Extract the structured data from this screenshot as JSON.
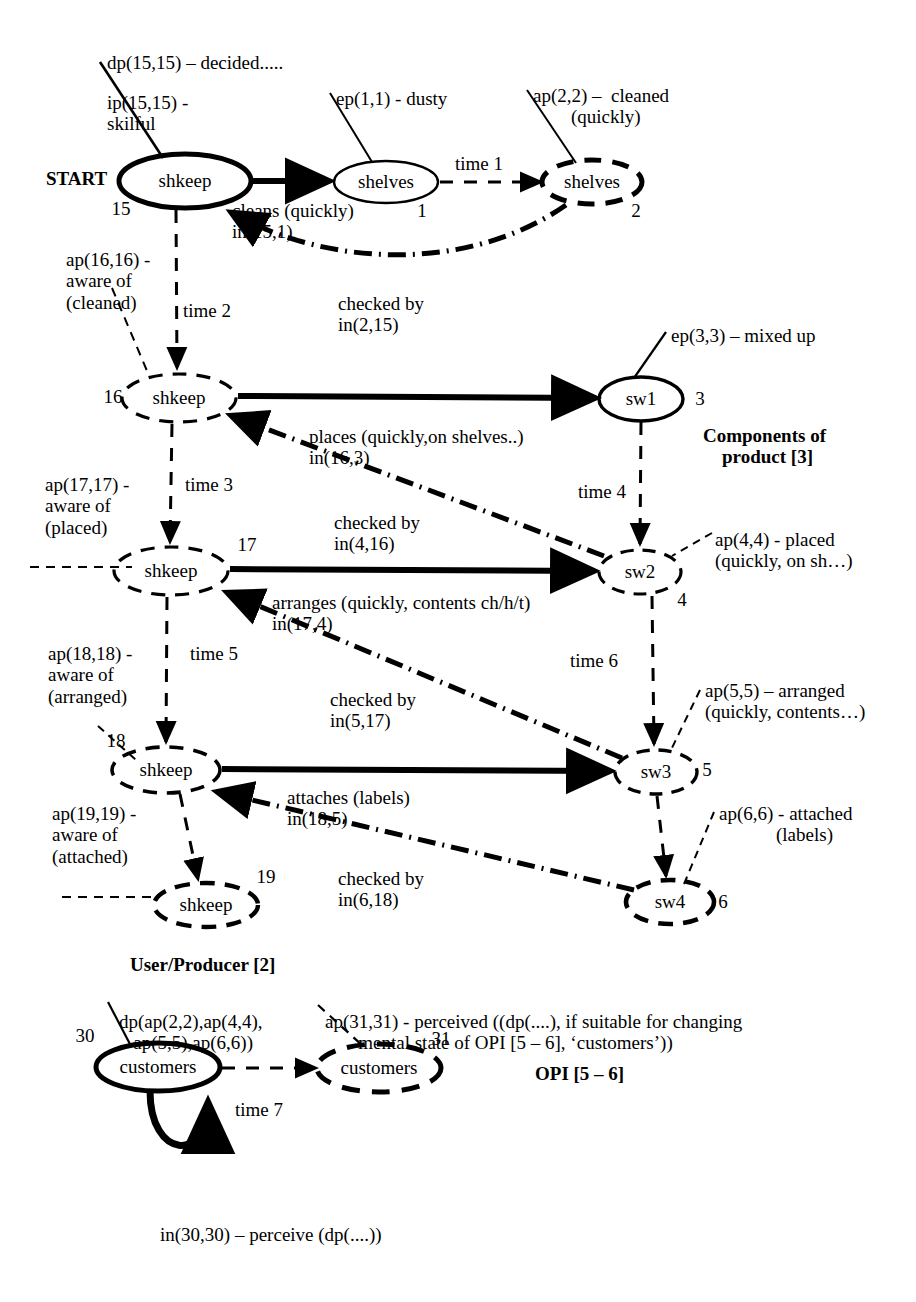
{
  "diagram": {
    "type": "state-transition-diagram",
    "colors": {
      "ink": "#000000",
      "paper": "#ffffff"
    },
    "groups": [
      {
        "id": "g-components",
        "label": "Components of\nproduct [3]"
      },
      {
        "id": "g-userproducer",
        "label": "User/Producer [2]"
      },
      {
        "id": "g-opi",
        "label": "OPI [5 – 6]"
      }
    ],
    "nodes": [
      {
        "id": "n15",
        "label": "shkeep",
        "num": "15",
        "style": "solid-bold",
        "cx": 185,
        "cy": 181,
        "rx": 66,
        "ry": 27,
        "num_x": 121,
        "num_y": 209
      },
      {
        "id": "n1",
        "label": "shelves",
        "num": "1",
        "style": "solid-thin",
        "cx": 386,
        "cy": 182,
        "rx": 52,
        "ry": 21,
        "num_x": 422,
        "num_y": 211
      },
      {
        "id": "n2",
        "label": "shelves",
        "num": "2",
        "style": "dashed-bold",
        "cx": 592,
        "cy": 182,
        "rx": 50,
        "ry": 22,
        "num_x": 636,
        "num_y": 211
      },
      {
        "id": "n16",
        "label": "shkeep",
        "num": "16",
        "style": "dashed",
        "cx": 179,
        "cy": 398,
        "rx": 57,
        "ry": 24,
        "num_x": 113,
        "num_y": 397
      },
      {
        "id": "n3",
        "label": "sw1",
        "num": "3",
        "style": "solid-bold",
        "cx": 641,
        "cy": 399,
        "rx": 42,
        "ry": 22,
        "num_x": 700,
        "num_y": 399
      },
      {
        "id": "n17",
        "label": "shkeep",
        "num": "17",
        "style": "dashed",
        "cx": 171,
        "cy": 571,
        "rx": 57,
        "ry": 24,
        "num_x": 247,
        "num_y": 545
      },
      {
        "id": "n4",
        "label": "sw2",
        "num": "4",
        "style": "dashed",
        "cx": 640,
        "cy": 572,
        "rx": 41,
        "ry": 22,
        "num_x": 682,
        "num_y": 600
      },
      {
        "id": "n18",
        "label": "shkeep",
        "num": "18",
        "style": "dashed",
        "cx": 166,
        "cy": 770,
        "rx": 54,
        "ry": 23,
        "num_x": 116,
        "num_y": 741
      },
      {
        "id": "n5",
        "label": "sw3",
        "num": "5",
        "style": "dashed",
        "cx": 656,
        "cy": 772,
        "rx": 41,
        "ry": 22,
        "num_x": 707,
        "num_y": 770
      },
      {
        "id": "n19",
        "label": "shkeep",
        "num": "19",
        "style": "dashed-bold",
        "cx": 206,
        "cy": 905,
        "rx": 52,
        "ry": 22,
        "num_x": 266,
        "num_y": 877
      },
      {
        "id": "n6",
        "label": "sw4",
        "num": "6",
        "style": "dashed-bold",
        "cx": 670,
        "cy": 902,
        "rx": 44,
        "ry": 22,
        "num_x": 723,
        "num_y": 902
      },
      {
        "id": "n30",
        "label": "customers",
        "num": "30",
        "style": "solid-bold",
        "cx": 158,
        "cy": 1067,
        "rx": 62,
        "ry": 24,
        "num_x": 85,
        "num_y": 1036
      },
      {
        "id": "n31",
        "label": "customers",
        "num": "31",
        "style": "dashed-bold",
        "cx": 379,
        "cy": 1068,
        "rx": 62,
        "ry": 24,
        "num_x": 441,
        "num_y": 1039
      }
    ],
    "edge_labels": [
      {
        "id": "e-cleans",
        "text": "cleans (quickly)\nin(15,1)",
        "x": 232,
        "y": 200,
        "align": "left"
      },
      {
        "id": "e-time1",
        "text": "time 1",
        "x": 455,
        "y": 153,
        "align": "left"
      },
      {
        "id": "e-checked1",
        "text": "checked by\nin(2,15)",
        "x": 338,
        "y": 293,
        "align": "left"
      },
      {
        "id": "e-time2",
        "text": "time 2",
        "x": 183,
        "y": 300,
        "align": "left"
      },
      {
        "id": "e-places",
        "text": "places (quickly,on shelves..)\nin(16,3)",
        "x": 309,
        "y": 426,
        "align": "left"
      },
      {
        "id": "e-time3",
        "text": "time 3",
        "x": 185,
        "y": 474,
        "align": "left"
      },
      {
        "id": "e-time4",
        "text": "time 4",
        "x": 578,
        "y": 481,
        "align": "left"
      },
      {
        "id": "e-checked2",
        "text": "checked by\nin(4,16)",
        "x": 334,
        "y": 512,
        "align": "left"
      },
      {
        "id": "e-arranges",
        "text": "arranges (quickly, contents ch/h/t)\nin(17,4)",
        "x": 272,
        "y": 592,
        "align": "left"
      },
      {
        "id": "e-time5",
        "text": "time 5",
        "x": 190,
        "y": 643,
        "align": "left"
      },
      {
        "id": "e-time6",
        "text": "time 6",
        "x": 570,
        "y": 650,
        "align": "left"
      },
      {
        "id": "e-checked3",
        "text": "checked by\nin(5,17)",
        "x": 330,
        "y": 689,
        "align": "left"
      },
      {
        "id": "e-attaches",
        "text": "attaches (labels)\nin(18,5)",
        "x": 287,
        "y": 787,
        "align": "left"
      },
      {
        "id": "e-checked4",
        "text": "checked by\nin(6,18)",
        "x": 338,
        "y": 868,
        "align": "left"
      },
      {
        "id": "e-time7",
        "text": "time 7",
        "x": 235,
        "y": 1099,
        "align": "left"
      },
      {
        "id": "e-in3030",
        "text": "in(30,30) – perceive (dp(....))",
        "x": 160,
        "y": 1224,
        "align": "left"
      }
    ],
    "annotations": [
      {
        "id": "a-dp1515",
        "text": "dp(15,15) – decided.....",
        "x": 107,
        "y": 52,
        "align": "left"
      },
      {
        "id": "a-ip1515",
        "text": "ip(15,15) -\nskilful",
        "x": 107,
        "y": 92,
        "align": "left"
      },
      {
        "id": "a-start",
        "text": "START",
        "x": 46,
        "y": 168,
        "align": "left",
        "bold": true
      },
      {
        "id": "a-ep11",
        "text": "ep(1,1) - dusty",
        "x": 336,
        "y": 88,
        "align": "left"
      },
      {
        "id": "a-ap22",
        "text": "ap(2,2) –  cleaned\n        (quickly)",
        "x": 533,
        "y": 85,
        "align": "left"
      },
      {
        "id": "a-ap1616",
        "text": "ap(16,16) -\naware of\n(cleaned)",
        "x": 66,
        "y": 249,
        "align": "left"
      },
      {
        "id": "a-ep33",
        "text": "ep(3,3) – mixed up",
        "x": 671,
        "y": 325,
        "align": "left"
      },
      {
        "id": "a-comp",
        "text": "Components of\n    product [3]",
        "x": 703,
        "y": 425,
        "align": "left",
        "bold": true
      },
      {
        "id": "a-ap1717",
        "text": "ap(17,17) -\naware of\n(placed)",
        "x": 45,
        "y": 474,
        "align": "left"
      },
      {
        "id": "a-ap44",
        "text": "ap(4,4) - placed\n(quickly, on sh…)",
        "x": 715,
        "y": 529,
        "align": "left"
      },
      {
        "id": "a-ap1818",
        "text": "ap(18,18) -\naware of\n(arranged)",
        "x": 48,
        "y": 643,
        "align": "left"
      },
      {
        "id": "a-ap55",
        "text": "ap(5,5) – arranged\n(quickly, contents…)",
        "x": 705,
        "y": 680,
        "align": "left"
      },
      {
        "id": "a-ap1919",
        "text": "ap(19,19) -\naware of\n(attached)",
        "x": 52,
        "y": 803,
        "align": "left"
      },
      {
        "id": "a-ap66",
        "text": "ap(6,6) - attached\n            (labels)",
        "x": 719,
        "y": 803,
        "align": "left"
      },
      {
        "id": "a-userprod",
        "text": "User/Producer [2]",
        "x": 130,
        "y": 954,
        "align": "left",
        "bold": true
      },
      {
        "id": "a-dpap",
        "text": "dp(ap(2,2),ap(4,4),\n   ap(5,5),ap(6,6))",
        "x": 119,
        "y": 1011,
        "align": "left"
      },
      {
        "id": "a-ap3131",
        "text": "ap(31,31) - perceived ((dp(....), if suitable for changing\n       mental state of OPI [5 – 6], ‘customers’))",
        "x": 325,
        "y": 1011,
        "align": "left"
      },
      {
        "id": "a-opi",
        "text": "OPI [5 – 6]",
        "x": 535,
        "y": 1063,
        "align": "left",
        "bold": true
      }
    ]
  }
}
